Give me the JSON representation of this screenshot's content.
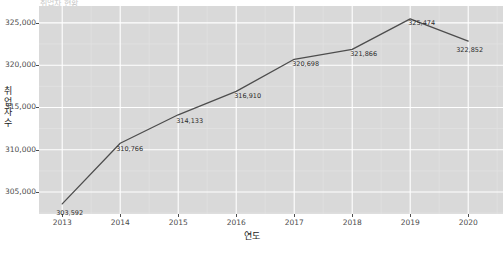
{
  "chart_data": {
    "type": "line",
    "title": "",
    "xlabel": "연도",
    "ylabel": "취업자수",
    "categories": [
      2013,
      2014,
      2015,
      2016,
      2017,
      2018,
      2019,
      2020
    ],
    "x_tick_labels": [
      "2013",
      "2014",
      "2015",
      "2016",
      "2017",
      "2018",
      "2019",
      "2020"
    ],
    "values": [
      303592,
      310766,
      314133,
      316910,
      320698,
      321866,
      325474,
      322852
    ],
    "point_labels": [
      "303,592",
      "310,766",
      "314,133",
      "316,910",
      "320,698",
      "321,866",
      "325,474",
      "322,852"
    ],
    "y_ticks": [
      305000,
      310000,
      315000,
      320000,
      325000
    ],
    "y_tick_labels": [
      "305,000",
      "310,000",
      "315,000",
      "320,000",
      "325,000"
    ],
    "ylim": [
      302400,
      327000
    ],
    "xlim": [
      2012.6,
      2020.6
    ],
    "grid": true,
    "legend": "none",
    "series_color": "#4d4d4d",
    "panel_color": "#d9d9d9",
    "gridline_color": "#ffffff"
  },
  "axis": {
    "y_title_chars": [
      "취",
      "업",
      "자",
      "수"
    ],
    "x_title": "연도"
  },
  "header": {
    "clipped_title": "취업자 현황"
  }
}
